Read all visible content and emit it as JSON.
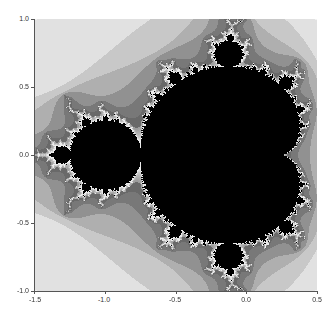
{
  "chart_data": {
    "type": "heatmap",
    "title": "",
    "subtitle": "",
    "xlabel": "",
    "ylabel": "",
    "xlim": [
      -1.5,
      0.5
    ],
    "ylim": [
      -1.0,
      1.0
    ],
    "x_ticks": [
      -1.5,
      -1.0,
      -0.5,
      0.0,
      0.5
    ],
    "y_ticks": [
      -1.0,
      -0.5,
      0.0,
      0.5,
      1.0
    ],
    "x_tick_labels": [
      "-1.5",
      "-1.0",
      "-0.5",
      "0.0",
      "0.5"
    ],
    "y_tick_labels": [
      "-1.0",
      "-0.5",
      "0.0",
      "0.5",
      "1.0"
    ],
    "grid": false,
    "legend": null,
    "colormap": "gray",
    "max_iterations": 60,
    "colors": {
      "interior": "#000000",
      "boundary": "#e8e8e8",
      "far_field": "#f2f2f2",
      "axis": "#555555",
      "tick_text": "#333333"
    }
  }
}
